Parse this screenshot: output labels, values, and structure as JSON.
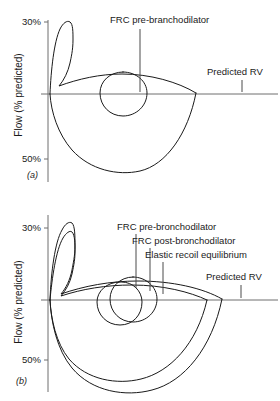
{
  "figure": {
    "axis": {
      "y_title": "Flow (% predicted)",
      "y_ticks_upper": [
        "30%",
        "50%"
      ],
      "y_ticks_lower": [
        "30%",
        "50%"
      ]
    },
    "panels": [
      {
        "letter": "(a)",
        "labels": [
          {
            "name": "frc-pre",
            "text": "FRC pre-branchodilator"
          },
          {
            "name": "predicted-rv",
            "text": "Predicted RV"
          }
        ]
      },
      {
        "letter": "(b)",
        "labels": [
          {
            "name": "frc-pre",
            "text": "FRC pre-bronchodilator"
          },
          {
            "name": "frc-post",
            "text": "FRC post-bronchodilator"
          },
          {
            "name": "elastic-recoil",
            "text": "Elastic recoil equilibrium"
          },
          {
            "name": "predicted-rv",
            "text": "Predicted RV"
          }
        ]
      }
    ],
    "colors": {
      "curve": "#1a1a1a",
      "axis": "#6e6e6e",
      "leader": "#4a4a4a",
      "background": "#ffffff"
    }
  }
}
